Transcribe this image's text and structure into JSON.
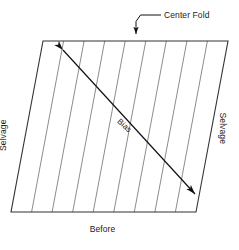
{
  "diagram": {
    "title_label": "Before",
    "callout_label": "Center Fold",
    "bias_label": "Bias",
    "selvage_left_label": "Selvage",
    "selvage_right_label": "Selvage",
    "colors": {
      "background": "#ffffff",
      "outline": "#333333",
      "grain_lines": "#8c8c8c",
      "arrow": "#111111",
      "text": "#1a1a1a"
    },
    "shape": {
      "type": "parallelogram",
      "points": [
        {
          "x": 43,
          "y": 41
        },
        {
          "x": 228,
          "y": 41
        },
        {
          "x": 196,
          "y": 212
        },
        {
          "x": 11,
          "y": 212
        }
      ],
      "skew_offset_px": 32,
      "width_px": 185,
      "height_px": 171
    },
    "grain_lines": {
      "count": 8,
      "orientation": "vertical",
      "top_x": [
        63.6,
        84.1,
        104.7,
        125.2,
        145.8,
        166.3,
        186.9,
        207.4
      ],
      "bottom_x": [
        31.6,
        52.1,
        72.7,
        93.2,
        113.8,
        134.3,
        154.9,
        175.4
      ],
      "y_top": 41,
      "y_bottom": 212
    },
    "bias_arrow": {
      "style": "double-headed",
      "start": {
        "x": 63,
        "y": 50
      },
      "end": {
        "x": 195,
        "y": 194
      },
      "angle_deg": 42.5
    },
    "callout": {
      "text_anchor": {
        "x": 164,
        "y": 15
      },
      "elbow": [
        {
          "x": 160,
          "y": 15
        },
        {
          "x": 140,
          "y": 15
        },
        {
          "x": 136,
          "y": 21
        },
        {
          "x": 136,
          "y": 33
        }
      ],
      "arrow_tip": {
        "x": 136,
        "y": 41
      },
      "points_to": "center-fold-line"
    }
  }
}
